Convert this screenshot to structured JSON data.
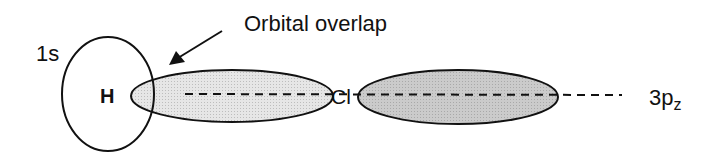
{
  "diagram": {
    "labels": {
      "hydrogen_orbital": "1s",
      "hydrogen_atom": "H",
      "overlap_caption": "Orbital overlap",
      "chlorine_atom": "Cl",
      "chlorine_orbital_main": "3p",
      "chlorine_orbital_sub": "z"
    },
    "colors": {
      "stroke": "#111111",
      "overlap_lobe_fill": "#e2e2e2",
      "back_lobe_fill": "#c9c9c9",
      "background": "#ffffff"
    }
  }
}
